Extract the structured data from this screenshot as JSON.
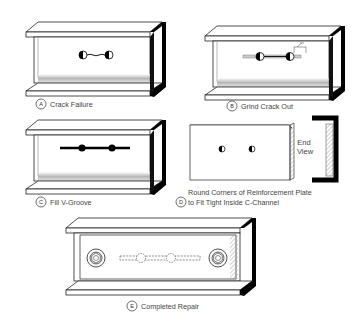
{
  "steps": [
    {
      "letter": "A",
      "caption": "Crack Failure"
    },
    {
      "letter": "B",
      "caption": "Grind Crack Out"
    },
    {
      "letter": "C",
      "caption": "Fill V-Groove"
    },
    {
      "letter": "D",
      "caption_line1": "Round Corners of Reinforcement Plate",
      "caption_line2": "to Fit Tight Inside C-Channel",
      "end_view_line1": "End",
      "end_view_line2": "View"
    },
    {
      "letter": "E",
      "caption": "Completed Repair"
    }
  ],
  "colors": {
    "line": "#222222",
    "shade": "#000000",
    "hatch": "#888888",
    "text": "#444444"
  }
}
